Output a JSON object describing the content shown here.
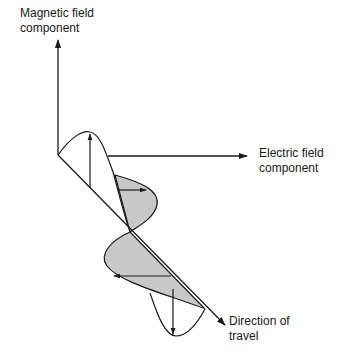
{
  "diagram": {
    "labels": {
      "magnetic": "Magnetic field\ncomponent",
      "electric": "Electric field\ncomponent",
      "direction": "Direction of\ntravel"
    },
    "colors": {
      "stroke": "#1a1a1a",
      "shaded_lobe": "#c8c8c8",
      "background": "#ffffff"
    }
  }
}
